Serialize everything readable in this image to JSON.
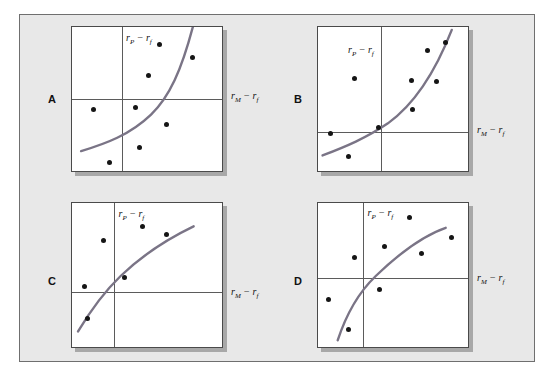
{
  "figure": {
    "background_color": "#e8e8e8",
    "frame_border_color": "#6f6f6f",
    "curve_color": "#7a7486",
    "dot_color": "#151515",
    "axis_color": "#5b5b5b",
    "y_axis_label": "rP − rf",
    "x_axis_label": "rM − rf",
    "y_axis_label_parts": {
      "base1": "r",
      "sub1": "P",
      "op": " − ",
      "base2": "r",
      "sub2": "f"
    },
    "x_axis_label_parts": {
      "base1": "r",
      "sub1": "M",
      "op": " − ",
      "base2": "r",
      "sub2": "f"
    }
  },
  "panels": [
    {
      "id": "A",
      "label": "A",
      "y_axis_label": "rP − rf",
      "x_axis_label": "rM − rf",
      "curve_shape": "convex-increasing",
      "origin_x_pct": 33,
      "origin_y_pct": 50,
      "points": [
        {
          "x": 58,
          "y": 12
        },
        {
          "x": 80,
          "y": 21
        },
        {
          "x": 51,
          "y": 34
        },
        {
          "x": 14,
          "y": 57
        },
        {
          "x": 42,
          "y": 56
        },
        {
          "x": 63,
          "y": 68
        },
        {
          "x": 45,
          "y": 84
        },
        {
          "x": 25,
          "y": 94
        }
      ],
      "curve_path": "M 6 85 C 22 80, 38 74, 52 60 C 64 48, 72 30, 80 -2"
    },
    {
      "id": "B",
      "label": "B",
      "y_axis_label": "rP − rf",
      "x_axis_label": "rM − rf",
      "curve_shape": "convex-increasing",
      "origin_x_pct": 42,
      "origin_y_pct": 73,
      "points": [
        {
          "x": 73,
          "y": 16
        },
        {
          "x": 85,
          "y": 11
        },
        {
          "x": 24,
          "y": 36
        },
        {
          "x": 62,
          "y": 37
        },
        {
          "x": 79,
          "y": 38
        },
        {
          "x": 63,
          "y": 57
        },
        {
          "x": 40,
          "y": 70
        },
        {
          "x": 8,
          "y": 74
        },
        {
          "x": 20,
          "y": 90
        }
      ],
      "curve_path": "M 3 88 C 18 82, 32 76, 46 66 C 62 54, 76 34, 88 2"
    },
    {
      "id": "C",
      "label": "C",
      "y_axis_label": "rP − rf",
      "x_axis_label": "rM − rf",
      "curve_shape": "concave-increasing",
      "origin_x_pct": 28,
      "origin_y_pct": 62,
      "points": [
        {
          "x": 47,
          "y": 16
        },
        {
          "x": 63,
          "y": 22
        },
        {
          "x": 21,
          "y": 26
        },
        {
          "x": 35,
          "y": 52
        },
        {
          "x": 8,
          "y": 58
        },
        {
          "x": 10,
          "y": 80
        }
      ],
      "curve_path": "M 4 88 C 12 74, 20 62, 32 50 C 48 34, 64 24, 80 16"
    },
    {
      "id": "D",
      "label": "D",
      "y_axis_label": "rP − rf",
      "x_axis_label": "rM − rf",
      "curve_shape": "concave-increasing",
      "origin_x_pct": 30,
      "origin_y_pct": 52,
      "points": [
        {
          "x": 61,
          "y": 10
        },
        {
          "x": 89,
          "y": 24
        },
        {
          "x": 44,
          "y": 30
        },
        {
          "x": 69,
          "y": 35
        },
        {
          "x": 24,
          "y": 38
        },
        {
          "x": 41,
          "y": 60
        },
        {
          "x": 7,
          "y": 67
        },
        {
          "x": 20,
          "y": 88
        }
      ],
      "curve_path": "M 13 94 C 18 78, 26 62, 38 50 C 54 34, 70 22, 84 17"
    }
  ]
}
